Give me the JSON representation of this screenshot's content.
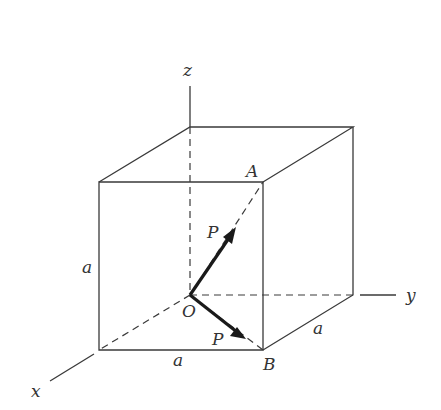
{
  "figure": {
    "type": "cube-with-force-vectors",
    "colors": {
      "line": "#3a3a3a",
      "vector": "#1a1a1a",
      "text": "#333333",
      "background": "#ffffff"
    },
    "axes": {
      "x_label": "x",
      "y_label": "y",
      "z_label": "z"
    },
    "points": {
      "origin_label": "O",
      "A_label": "A",
      "B_label": "B"
    },
    "vectors": [
      {
        "label": "P",
        "from": "O",
        "toward": "A"
      },
      {
        "label": "P",
        "from": "O",
        "toward": "B"
      }
    ],
    "dimensions": {
      "height_label": "a",
      "width_label": "a",
      "depth_label": "a"
    }
  }
}
